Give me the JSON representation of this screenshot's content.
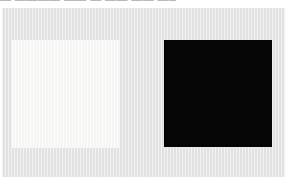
{
  "caption": {
    "text": "— ———— —— — —— —— ———",
    "note": "caption text clipped by top edge of screenshot; glyphs not legible"
  },
  "panel": {
    "name": "image-panel",
    "background_color": "#e4e4e4"
  },
  "swatches": [
    {
      "name": "white-square",
      "label": "",
      "color": "#f7f7f5"
    },
    {
      "name": "black-square",
      "label": "",
      "color": "#050505"
    }
  ],
  "page": {
    "background_color": "#ffffff"
  }
}
